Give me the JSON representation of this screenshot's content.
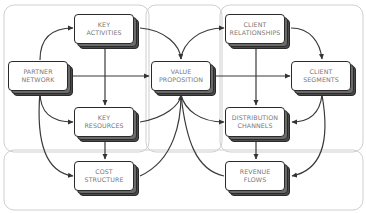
{
  "diagram": {
    "type": "business-model-flow",
    "regions": [
      {
        "id": "left",
        "label": ""
      },
      {
        "id": "center",
        "label": ""
      },
      {
        "id": "right",
        "label": ""
      },
      {
        "id": "bottom",
        "label": ""
      }
    ],
    "nodes": {
      "key_activities": {
        "line1": "KEY",
        "line2": "ACTIVITIES"
      },
      "partner_network": {
        "line1": "PARTNER",
        "line2": "NETWORK"
      },
      "value_proposition": {
        "line1": "VALUE",
        "line2": "PROPOSITION"
      },
      "key_resources": {
        "line1": "KEY",
        "line2": "RESOURCES"
      },
      "cost_structure": {
        "line1": "COST",
        "line2": "STRUCTURE"
      },
      "client_relationships": {
        "line1": "CLIENT",
        "line2": "RELATIONSHIPS"
      },
      "client_segments": {
        "line1": "CLIENT",
        "line2": "SEGMENTS"
      },
      "distribution_channels": {
        "line1": "DISTRIBUTION",
        "line2": "CHANNELS"
      },
      "revenue_flows": {
        "line1": "REVENUE",
        "line2": "FLOWS"
      }
    },
    "edges": [
      {
        "from": "partner_network",
        "to": "key_activities"
      },
      {
        "from": "partner_network",
        "to": "value_proposition"
      },
      {
        "from": "partner_network",
        "to": "key_resources"
      },
      {
        "from": "partner_network",
        "to": "cost_structure"
      },
      {
        "from": "key_activities",
        "to": "value_proposition"
      },
      {
        "from": "key_activities",
        "to": "key_resources"
      },
      {
        "from": "key_resources",
        "to": "cost_structure"
      },
      {
        "from": "key_resources",
        "to": "value_proposition"
      },
      {
        "from": "cost_structure",
        "to": "value_proposition"
      },
      {
        "from": "value_proposition",
        "to": "client_relationships"
      },
      {
        "from": "value_proposition",
        "to": "client_segments"
      },
      {
        "from": "value_proposition",
        "to": "distribution_channels"
      },
      {
        "from": "value_proposition",
        "to": "revenue_flows"
      },
      {
        "from": "client_relationships",
        "to": "client_segments"
      },
      {
        "from": "client_relationships",
        "to": "distribution_channels"
      },
      {
        "from": "distribution_channels",
        "to": "revenue_flows"
      },
      {
        "from": "client_segments",
        "to": "distribution_channels"
      },
      {
        "from": "client_segments",
        "to": "revenue_flows"
      }
    ],
    "colors": {
      "line": "#3a3a3a",
      "region_border": "#c8c8c8",
      "box_fill": "#ffffff",
      "box_shadow": "#3a3a3a",
      "text": "#777777"
    }
  }
}
